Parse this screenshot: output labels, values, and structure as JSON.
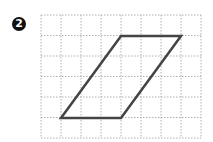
{
  "problem": {
    "number": "2"
  },
  "figure": {
    "shape": "parallelogram",
    "grid": {
      "cols": 8,
      "rows": 6,
      "left": 41,
      "top": 15,
      "right": 201,
      "bottom": 138
    },
    "vertices": [
      [
        61,
        118
      ],
      [
        121,
        118
      ],
      [
        181,
        36
      ],
      [
        121,
        36
      ]
    ],
    "grid_color": "#b0b0b0",
    "shape_color": "#444444"
  }
}
